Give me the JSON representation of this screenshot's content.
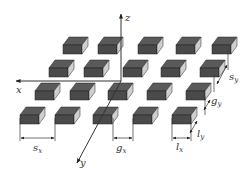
{
  "figure": {
    "colors": {
      "block_top": "#5a5a5a",
      "block_front": "#4a4a4a",
      "block_side": "#cfcfcf",
      "axis": "#333333",
      "background": "#ffffff"
    },
    "axes": {
      "x": {
        "label": "x"
      },
      "y": {
        "label": "y"
      },
      "z": {
        "label": "z"
      }
    },
    "dimensions": {
      "sx": {
        "main": "s",
        "sub": "x"
      },
      "gx": {
        "main": "g",
        "sub": "x"
      },
      "lx": {
        "main": "l",
        "sub": "x"
      },
      "ly": {
        "main": "l",
        "sub": "y"
      },
      "gy": {
        "main": "g",
        "sub": "y"
      },
      "sy": {
        "main": "s",
        "sub": "y"
      }
    },
    "grid": {
      "rows": 4,
      "cols": 5
    }
  }
}
